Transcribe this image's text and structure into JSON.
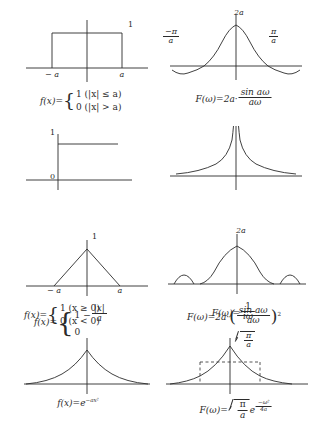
{
  "figure": {
    "background_color": "#ffffff",
    "stroke_color": "#2b2b2b"
  },
  "rows": [
    {
      "id": "rectangular-pulse",
      "left": {
        "plot": {
          "kind": "rectangular-pulse",
          "peak_label": "1",
          "x_tick_left": "− a",
          "x_tick_right": "a"
        },
        "formula": {
          "lhs": "f(x)=",
          "case_1": "1  (|x| ≤ a)",
          "case_2": "0  (|x| > a)"
        }
      },
      "right": {
        "plot": {
          "kind": "sinc",
          "peak_label": "2a",
          "x_tick_left_num": "−π",
          "x_tick_left_den": "a",
          "x_tick_right_num": "π",
          "x_tick_right_den": "a"
        },
        "formula": {
          "lhs": "F(ω)=2a·",
          "frac_num": "sin aω",
          "frac_den": "aω"
        }
      }
    },
    {
      "id": "unit-step",
      "left": {
        "plot": {
          "kind": "unit-step",
          "peak_label": "1",
          "origin_label": "0"
        },
        "formula": {
          "lhs": "f(x)=",
          "case_1": "1  (x ≥ 0)",
          "case_2": "0  (x < 0)"
        }
      },
      "right": {
        "plot": {
          "kind": "reciprocal-omega"
        },
        "formula": {
          "lhs": "F(ω)=",
          "frac_num": "1",
          "frac_den": "iω"
        }
      }
    },
    {
      "id": "triangular-pulse",
      "left": {
        "plot": {
          "kind": "triangle",
          "peak_label": "1",
          "x_tick_left": "− a",
          "x_tick_right": "a"
        },
        "formula": {
          "lhs": "f(x)=",
          "case_1_prefix": "1 −",
          "case_1_num": "|x|",
          "case_1_den": "a",
          "case_2": "0"
        }
      },
      "right": {
        "plot": {
          "kind": "sinc-squared",
          "peak_label": "2a"
        },
        "formula": {
          "lhs": "F(ω)=2a·",
          "frac_num": "sin aω",
          "frac_den": "aω",
          "power": "2"
        }
      }
    },
    {
      "id": "gaussian",
      "left": {
        "plot": {
          "kind": "gaussian"
        },
        "formula": {
          "lhs": "f(x)=e",
          "exponent": "−ax²"
        }
      },
      "right": {
        "plot": {
          "kind": "gaussian-wide",
          "peak_num": "π",
          "peak_den": "a"
        },
        "formula": {
          "lhs": "F(ω)=",
          "rad_num": "π",
          "rad_den": "a",
          "exp_base": "e",
          "exp_num": "−ω²",
          "exp_den": "4a"
        }
      }
    }
  ]
}
